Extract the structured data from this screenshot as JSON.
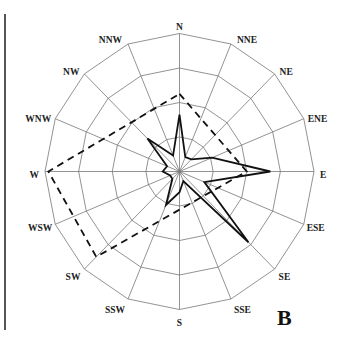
{
  "chart_data": {
    "type": "radar",
    "title": "",
    "panel_label": "B",
    "directions": [
      "N",
      "NNE",
      "NE",
      "ENE",
      "E",
      "ESE",
      "SE",
      "SSE",
      "S",
      "SSW",
      "SW",
      "WSW",
      "W",
      "WNW",
      "NW",
      "NNW"
    ],
    "rings": 4,
    "r_max": 4,
    "grid": true,
    "series": [
      {
        "name": "solid",
        "style": "solid",
        "color": "#111111",
        "values": [
          1.65,
          0.45,
          0.5,
          1.05,
          2.7,
          0.8,
          2.9,
          0.3,
          0.6,
          1.05,
          0.3,
          0.3,
          0.5,
          0.4,
          1.35,
          0.5
        ]
      },
      {
        "name": "dashed",
        "style": "dashed",
        "color": "#111111",
        "vertices": {
          "W": 3.9,
          "N": 2.25,
          "E": 2.0,
          "SW": 3.5
        }
      }
    ]
  },
  "labels": {
    "N": "N",
    "NNE": "NNE",
    "NE": "NE",
    "ENE": "ENE",
    "E": "E",
    "ESE": "ESE",
    "SE": "SE",
    "SSE": "SSE",
    "S": "S",
    "SSW": "SSW",
    "SW": "SW",
    "WSW": "WSW",
    "W": "W",
    "WNW": "WNW",
    "NW": "NW",
    "NNW": "NNW"
  },
  "panel_label": "B"
}
